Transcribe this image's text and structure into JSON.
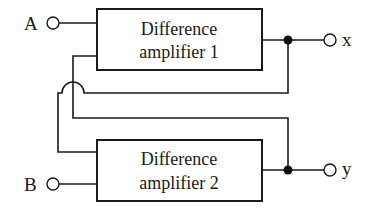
{
  "diagram": {
    "type": "block-diagram",
    "blocks": [
      {
        "id": "amp1",
        "line1": "Difference",
        "line2": "amplifier 1"
      },
      {
        "id": "amp2",
        "line1": "Difference",
        "line2": "amplifier 2"
      }
    ],
    "inputs": [
      {
        "id": "A",
        "label": "A",
        "connects_to": "amp1"
      },
      {
        "id": "B",
        "label": "B",
        "connects_to": "amp2"
      }
    ],
    "outputs": [
      {
        "id": "x",
        "label": "x",
        "from": "amp1"
      },
      {
        "id": "y",
        "label": "y",
        "from": "amp2"
      }
    ],
    "feedback": [
      {
        "from": "x",
        "to": "amp2",
        "note": "crosses other wire with a hop"
      },
      {
        "from": "y",
        "to": "amp1"
      }
    ],
    "colors": {
      "line": "#1a1a1a",
      "background": "#ffffff"
    }
  }
}
